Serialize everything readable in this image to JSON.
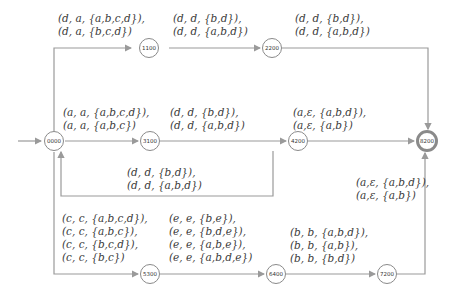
{
  "diagram": {
    "type": "state-transition-graph",
    "nodes": [
      {
        "id": "0000",
        "label": "0000",
        "initial": true
      },
      {
        "id": "1100",
        "label": "1100"
      },
      {
        "id": "2200",
        "label": "2200"
      },
      {
        "id": "3100",
        "label": "3100"
      },
      {
        "id": "4200",
        "label": "4200"
      },
      {
        "id": "5300",
        "label": "5300"
      },
      {
        "id": "6400",
        "label": "6400"
      },
      {
        "id": "7200",
        "label": "7200"
      },
      {
        "id": "8200",
        "label": "8200",
        "final": true
      }
    ],
    "edges": [
      {
        "from": "0000",
        "to": "1100",
        "lines": [
          "(d, a, {a,b,c,d}),",
          "(d, a, {b,c,d})"
        ]
      },
      {
        "from": "1100",
        "to": "2200",
        "lines": [
          "(d, d, {b,d}),",
          "(d, d, {a,b,d})"
        ]
      },
      {
        "from": "2200",
        "to": "8200",
        "lines": [
          "(d, d, {b,d}),",
          "(d, d, {a,b,d})"
        ]
      },
      {
        "from": "0000",
        "to": "3100",
        "lines": [
          "(a, a, {a,b,c,d}),",
          "(a, a, {a,b,c})"
        ]
      },
      {
        "from": "3100",
        "to": "4200",
        "lines": [
          "(d, d, {b,d}),",
          "(d, d, {a,b,d})"
        ]
      },
      {
        "from": "4200",
        "to": "0000",
        "lines": [
          "(d, d, {b,d}),",
          "(d, d, {a,b,d})"
        ]
      },
      {
        "from": "4200",
        "to": "8200",
        "lines": [
          "(a,ε, {a,b,d}),",
          "(a,ε, {a,b})"
        ]
      },
      {
        "from": "0000",
        "to": "5300",
        "lines": [
          "(c, c, {a,b,c,d}),",
          "(c, c, {a,b,c}),",
          "(c, c, {b,c,d}),",
          "(c, c, {b,c})"
        ]
      },
      {
        "from": "5300",
        "to": "6400",
        "lines": [
          "(e, e, {b,e}),",
          "(e, e, {b,d,e}),",
          "(e, e, {a,b,e}),",
          "(e, e, {a,b,d,e})"
        ]
      },
      {
        "from": "6400",
        "to": "7200",
        "lines": [
          "(b, b, {a,b,d}),",
          "(b, b, {a,b}),",
          "(b, b, {b,d})"
        ]
      },
      {
        "from": "7200",
        "to": "8200",
        "lines": [
          "(a,ε, {a,b,d}),",
          "(a,ε, {a,b})"
        ]
      }
    ]
  },
  "labels": {
    "e_0000_1100": {
      "l1": "(d, a, {a,b,c,d}),",
      "l2": "(d, a, {b,c,d})"
    },
    "e_1100_2200": {
      "l1": "(d, d, {b,d}),",
      "l2": "(d, d, {a,b,d})"
    },
    "e_2200_8200": {
      "l1": "(d, d, {b,d}),",
      "l2": "(d, d, {a,b,d})"
    },
    "e_0000_3100": {
      "l1": "(a, a, {a,b,c,d}),",
      "l2": "(a, a, {a,b,c})"
    },
    "e_3100_4200": {
      "l1": "(d, d, {b,d}),",
      "l2": "(d, d, {a,b,d})"
    },
    "e_4200_0000": {
      "l1": "(d, d, {b,d}),",
      "l2": "(d, d, {a,b,d})"
    },
    "e_4200_8200": {
      "l1": "(a,ε, {a,b,d}),",
      "l2": "(a,ε, {a,b})"
    },
    "e_0000_5300": {
      "l1": "(c, c, {a,b,c,d}),",
      "l2": "(c, c, {a,b,c}),",
      "l3": "(c, c, {b,c,d}),",
      "l4": "(c, c, {b,c})"
    },
    "e_5300_6400": {
      "l1": "(e, e, {b,e}),",
      "l2": "(e, e, {b,d,e}),",
      "l3": "(e, e, {a,b,e}),",
      "l4": "(e, e, {a,b,d,e})"
    },
    "e_6400_7200": {
      "l1": "(b, b, {a,b,d}),",
      "l2": "(b, b, {a,b}),",
      "l3": "(b, b, {b,d})"
    },
    "e_7200_8200": {
      "l1": "(a,ε, {a,b,d}),",
      "l2": "(a,ε, {a,b})"
    }
  },
  "colors": {
    "edge": "#9a9a9a",
    "node_border": "#8a8a8a",
    "text": "#3a3a3a"
  }
}
